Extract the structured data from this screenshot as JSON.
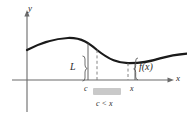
{
  "figure": {
    "axes": {
      "y_label": "y",
      "x_label": "x",
      "y_axis_x": 27,
      "x_axis_y": 80,
      "arrow_icon": "arrowhead-icon"
    },
    "curve": {
      "name": "f",
      "stroke_color": "#1a1a1a",
      "stroke_width": 2.2,
      "points": [
        [
          27,
          50
        ],
        [
          40,
          44
        ],
        [
          52,
          40
        ],
        [
          68,
          38
        ],
        [
          82,
          41
        ],
        [
          96,
          50
        ],
        [
          112,
          59
        ],
        [
          128,
          63
        ],
        [
          142,
          63
        ],
        [
          158,
          59
        ],
        [
          172,
          56
        ],
        [
          186,
          54
        ]
      ]
    },
    "verticals": [
      {
        "name": "c-solid-line",
        "x": 88,
        "y_top": 43,
        "style": "solid",
        "color": "#555555"
      },
      {
        "name": "c-dashed-line",
        "x": 97,
        "y_top": 50,
        "style": "dashed",
        "color": "#777777"
      },
      {
        "name": "x-dashed-line",
        "x": 128,
        "y_top": 63,
        "style": "dashed",
        "color": "#777777"
      },
      {
        "name": "x-solid-line",
        "x": 135,
        "y_top": 63,
        "style": "solid",
        "color": "#555555"
      }
    ],
    "braces": {
      "L_brace_color": "#555555",
      "fx_brace_color": "#555555"
    },
    "labels": {
      "L": "L",
      "fx": "f(x)",
      "c": "c",
      "x": "x",
      "relation": "c < x"
    },
    "highlight": {
      "name": "interval-highlight-bar",
      "color": "#c9c9c9"
    },
    "background_color": "#ffffff"
  }
}
